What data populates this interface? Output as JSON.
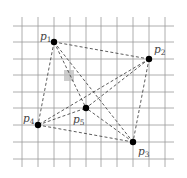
{
  "diagram": {
    "type": "complete-graph-on-grid",
    "background_color": "#ffffff",
    "grid": {
      "color": "#9a9a9a",
      "vertical_x": [
        22,
        38,
        54,
        70,
        86,
        101,
        117,
        133,
        149,
        165
      ],
      "vertical_y_range": [
        17,
        167
      ],
      "horizontal_y": [
        26,
        42,
        59,
        75,
        92,
        108,
        125,
        142,
        159
      ],
      "horizontal_x_range": [
        13,
        174
      ]
    },
    "highlight_cell": {
      "x": 64,
      "y": 70,
      "width": 10,
      "height": 11,
      "color": "#bdbdbd"
    },
    "vertices": [
      {
        "id": "p1",
        "name": "p",
        "sub": "1",
        "x": 54,
        "y": 42,
        "label_x": 40,
        "label_y": 40
      },
      {
        "id": "p2",
        "name": "p",
        "sub": "2",
        "x": 149,
        "y": 59,
        "label_x": 154,
        "label_y": 53
      },
      {
        "id": "p3",
        "name": "p",
        "sub": "3",
        "x": 133,
        "y": 142,
        "label_x": 138,
        "label_y": 155
      },
      {
        "id": "p4",
        "name": "p",
        "sub": "4",
        "x": 38,
        "y": 125,
        "label_x": 23,
        "label_y": 122
      },
      {
        "id": "p5",
        "name": "p",
        "sub": "5",
        "x": 86,
        "y": 108,
        "label_x": 73,
        "label_y": 123
      }
    ],
    "edges": [
      [
        "p1",
        "p2"
      ],
      [
        "p1",
        "p3"
      ],
      [
        "p1",
        "p4"
      ],
      [
        "p1",
        "p5"
      ],
      [
        "p2",
        "p3"
      ],
      [
        "p2",
        "p4"
      ],
      [
        "p2",
        "p5"
      ],
      [
        "p3",
        "p4"
      ],
      [
        "p3",
        "p5"
      ],
      [
        "p4",
        "p5"
      ]
    ],
    "edge_style": {
      "color": "#333333",
      "dashed": true
    },
    "vertex_color": "#000000",
    "label_color": "#444444"
  }
}
